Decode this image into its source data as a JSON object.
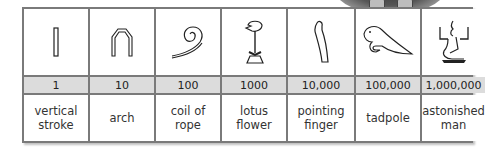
{
  "table": {
    "columns": [
      {
        "glyph": "vertical-stroke-icon",
        "value": "1",
        "name": "vertical stroke"
      },
      {
        "glyph": "arch-icon",
        "value": "10",
        "name": "arch"
      },
      {
        "glyph": "coil-of-rope-icon",
        "value": "100",
        "name": "coil of rope"
      },
      {
        "glyph": "lotus-flower-icon",
        "value": "1000",
        "name": "lotus flower"
      },
      {
        "glyph": "pointing-finger-icon",
        "value": "10,000",
        "name": "pointing finger"
      },
      {
        "glyph": "tadpole-icon",
        "value": "100,000",
        "name": "tadpole"
      },
      {
        "glyph": "astonished-man-icon",
        "value": "1,000,000",
        "name": "astonished man"
      }
    ]
  },
  "colors": {
    "border": "#7a7a7a",
    "number_row": "#dcdcdc"
  }
}
